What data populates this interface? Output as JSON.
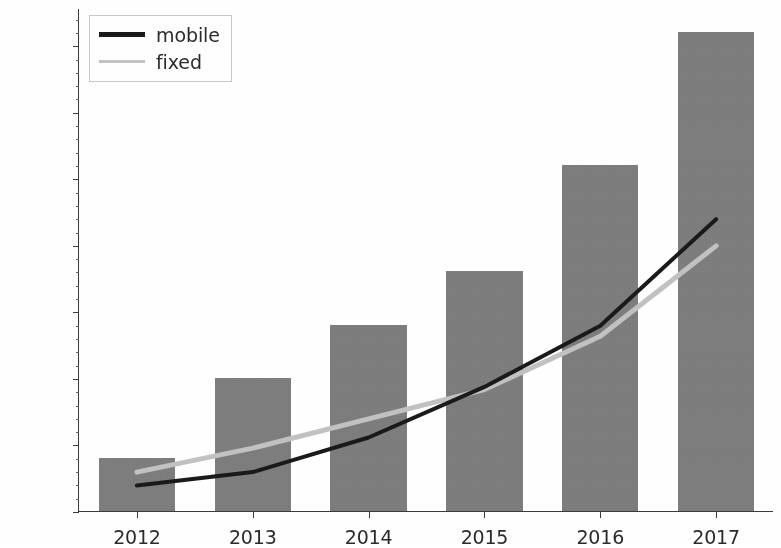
{
  "chart_data": {
    "type": "bar",
    "title": "",
    "xlabel": "",
    "ylabel": "",
    "categories": [
      "2012",
      "2013",
      "2014",
      "2015",
      "2016",
      "2017"
    ],
    "values": [
      2000,
      5000,
      7000,
      9000,
      13000,
      18000
    ],
    "series": [
      {
        "name": "bars",
        "type": "bar",
        "color": "#7d7d7d",
        "values": [
          2000,
          5000,
          7000,
          9000,
          13000,
          18000
        ]
      },
      {
        "name": "mobile",
        "type": "line",
        "color": "#1a1a1a",
        "values": [
          1000,
          1500,
          2800,
          4700,
          7000,
          11000
        ]
      },
      {
        "name": "fixed",
        "type": "line",
        "color": "#c2c2c2",
        "values": [
          1500,
          2400,
          3500,
          4600,
          6600,
          10000
        ]
      }
    ],
    "ylim": [
      0,
      18900
    ],
    "yticks": [
      0,
      2500,
      5000,
      7500,
      10000,
      12500,
      15000,
      17500
    ],
    "ytick_labels": [
      "0",
      "2500",
      "5000",
      "7500",
      "10000",
      "12500",
      "15000",
      "17500"
    ],
    "xtick_labels": [
      "2012",
      "2013",
      "2014",
      "2015",
      "2016",
      "2017"
    ],
    "grid": false,
    "legend": {
      "position": "upper left",
      "entries": [
        {
          "label": "mobile",
          "swatch": "thick-dark-line"
        },
        {
          "label": "fixed",
          "swatch": "thin-light-line"
        }
      ]
    },
    "colors": {
      "bar": "#7d7d7d",
      "mobile_line": "#1a1a1a",
      "fixed_line": "#c2c2c2",
      "axis": "#3b3b3b",
      "text": "#2b2b2b",
      "background": "#ffffff"
    }
  }
}
